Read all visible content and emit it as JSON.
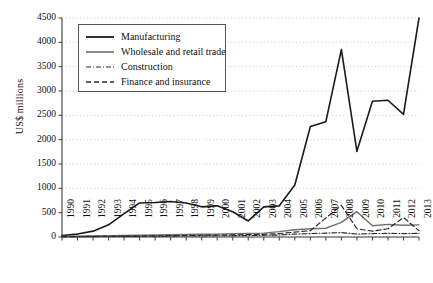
{
  "chart_data": {
    "type": "line",
    "title": "",
    "xlabel": "",
    "ylabel": "US$ millions",
    "ylim": [
      0,
      4500
    ],
    "ytick_step": 500,
    "yticks": [
      0,
      500,
      1000,
      1500,
      2000,
      2500,
      3000,
      3500,
      4000,
      4500
    ],
    "grid": true,
    "legend_position": "upper-left-inside",
    "categories": [
      "1990",
      "1991",
      "1992",
      "1993",
      "1994",
      "1995",
      "1996",
      "1997",
      "1998",
      "1999",
      "2000",
      "2001",
      "2002",
      "2003",
      "2004",
      "2005",
      "2006",
      "2007",
      "2008",
      "2009",
      "2010",
      "2011",
      "2012",
      "2013"
    ],
    "series": [
      {
        "name": "Manufacturing",
        "style": "solid",
        "color": "#1a1a1a",
        "width": 1.6,
        "values": [
          30,
          60,
          120,
          250,
          480,
          700,
          710,
          730,
          700,
          620,
          640,
          520,
          330,
          620,
          640,
          1070,
          2270,
          2370,
          3850,
          1760,
          2790,
          2810,
          2520,
          4500
        ]
      },
      {
        "name": "Wholesale and retail trade",
        "style": "solid",
        "color": "#707070",
        "width": 1.4,
        "values": [
          10,
          15,
          20,
          25,
          30,
          35,
          40,
          45,
          50,
          55,
          60,
          70,
          75,
          80,
          110,
          150,
          170,
          180,
          300,
          520,
          230,
          260,
          240,
          250
        ]
      },
      {
        "name": "Construction",
        "style": "dashdot",
        "color": "#2a2a2a",
        "width": 1.1,
        "values": [
          5,
          6,
          8,
          10,
          12,
          14,
          16,
          18,
          20,
          22,
          25,
          28,
          30,
          35,
          40,
          60,
          70,
          80,
          90,
          60,
          70,
          75,
          70,
          75
        ]
      },
      {
        "name": "Finance and insurance",
        "style": "dashed",
        "color": "#2a2a2a",
        "width": 1.2,
        "values": [
          8,
          10,
          12,
          15,
          18,
          20,
          24,
          28,
          32,
          36,
          40,
          45,
          50,
          55,
          70,
          100,
          130,
          390,
          650,
          170,
          120,
          170,
          400,
          130
        ]
      }
    ]
  },
  "legend": {
    "items": [
      {
        "label": "Manufacturing"
      },
      {
        "label": "Wholesale and retail trade"
      },
      {
        "label": "Construction"
      },
      {
        "label": "Finance and insurance"
      }
    ]
  }
}
